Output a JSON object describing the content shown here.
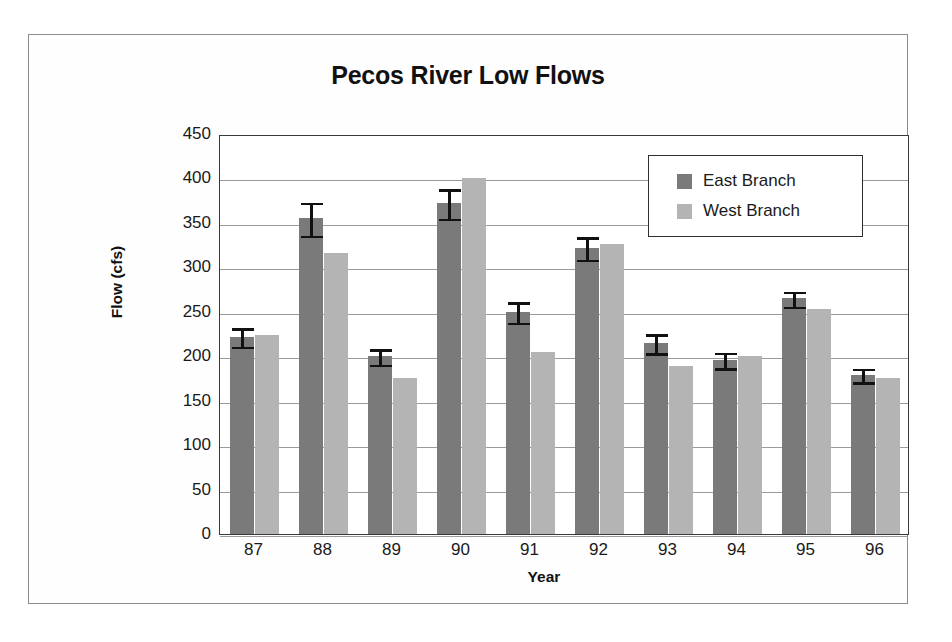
{
  "figure": {
    "border_color": "#8c8c8c",
    "background": "#ffffff"
  },
  "chart_data": {
    "type": "bar",
    "title": "Pecos River Low Flows",
    "subtitle": "",
    "xlabel": "Year",
    "ylabel": "Flow (cfs)",
    "categories": [
      "87",
      "88",
      "89",
      "90",
      "91",
      "92",
      "93",
      "94",
      "95",
      "96"
    ],
    "ylim": [
      0,
      450
    ],
    "ytick_step": 50,
    "yticks": [
      450,
      400,
      350,
      300,
      250,
      200,
      150,
      100,
      50,
      0
    ],
    "grid": "horizontal",
    "legend_position": "inside-top-right",
    "error_bars": "East Branch only",
    "series": [
      {
        "name": "East Branch",
        "color": "#7a7a7a",
        "values": [
          222,
          355,
          200,
          372,
          250,
          322,
          215,
          196,
          265,
          179
        ],
        "errors": [
          12,
          20,
          10,
          18,
          13,
          14,
          12,
          10,
          10,
          9
        ]
      },
      {
        "name": "West Branch",
        "color": "#b4b4b4",
        "values": [
          224,
          316,
          176,
          400,
          205,
          326,
          189,
          200,
          253,
          176
        ],
        "errors": [
          0,
          0,
          0,
          0,
          0,
          0,
          0,
          0,
          0,
          0
        ]
      }
    ]
  },
  "legend": {
    "items": [
      {
        "label": "East Branch",
        "color": "#7a7a7a"
      },
      {
        "label": "West Branch",
        "color": "#b4b4b4"
      }
    ]
  }
}
